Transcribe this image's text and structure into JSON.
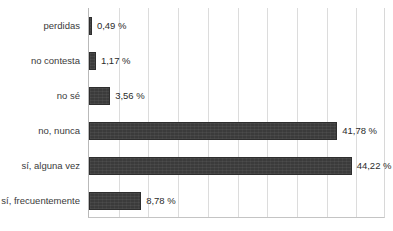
{
  "chart_data": {
    "type": "bar",
    "orientation": "horizontal",
    "title": "",
    "subtitle": "",
    "xlabel": "",
    "ylabel": "",
    "xlim": [
      0,
      50
    ],
    "grid": true,
    "legend": false,
    "legend_position": "none",
    "gridline_interval": 5,
    "value_suffix": " %",
    "decimal_separator": ",",
    "bar_color": "#3b3b3b",
    "gridline_color": "#dcdcdc",
    "axis_color": "#b9b9b9",
    "background_color": "#ffffff",
    "categories": [
      "perdidas",
      "no contesta",
      "no sé",
      "no, nunca",
      "sí, alguna vez",
      "sí, frecuentemente"
    ],
    "values": [
      0.49,
      1.17,
      3.56,
      41.78,
      44.22,
      8.78
    ],
    "value_labels": [
      "0,49 %",
      "1,17 %",
      "3,56 %",
      "41,78 %",
      "44,22 %",
      "8,78 %"
    ]
  }
}
